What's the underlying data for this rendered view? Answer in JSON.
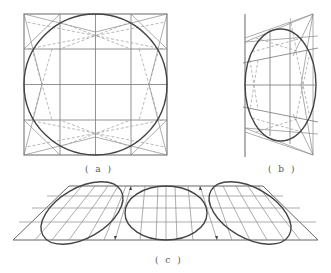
{
  "figure": {
    "panels": [
      {
        "id": "a",
        "label": "( a )",
        "description": "Circle inscribed in a square with 4x4 grid and dashed construction lines"
      },
      {
        "id": "b",
        "label": "( b )",
        "description": "Ellipse inscribed in a perspective quadrilateral with grid and dashed construction lines"
      },
      {
        "id": "c",
        "label": "( c )",
        "description": "Three ellipses inscribed in a trapezoid strip with perspective grid lines and arrows"
      }
    ]
  },
  "colors": {
    "line": "#777777",
    "curve": "#444444",
    "dash": "#999999",
    "background": "#ffffff"
  }
}
